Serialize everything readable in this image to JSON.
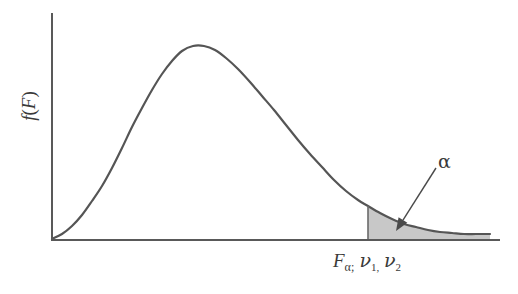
{
  "figure": {
    "background_color": "#ffffff",
    "curve_color": "#555555",
    "axis_color": "#595959",
    "shade_color": "#c8c8c8",
    "text_color": "#3a3a3a"
  },
  "labels": {
    "y_axis": "f(F)",
    "y_axis_func": "f",
    "y_axis_open": "(",
    "y_axis_var": "F",
    "y_axis_close": ")",
    "x_axis_base": "F",
    "x_axis_sub_alpha": "α;",
    "x_axis_nu": "ν",
    "x_axis_nu1": "1,",
    "x_axis_nu2": "2",
    "tail_annotation": "α"
  },
  "chart_data": {
    "type": "line",
    "title": "",
    "xlabel": "Fα; ν1, ν2",
    "ylabel": "f(F)",
    "grid": false,
    "legend": "none",
    "distribution": "F-distribution probability density",
    "axis_pixel_geometry": {
      "y_axis_x": 52,
      "y_axis_top_y": 13,
      "baseline_y": 240,
      "baseline_right_x": 500,
      "curve_right_end_x": 490
    },
    "peak": {
      "x": 193,
      "y": 46
    },
    "critical_value_x": 368,
    "curve_points": [
      [
        52,
        239
      ],
      [
        62,
        234
      ],
      [
        72,
        226
      ],
      [
        82,
        215
      ],
      [
        92,
        201
      ],
      [
        102,
        186
      ],
      [
        112,
        168
      ],
      [
        122,
        148
      ],
      [
        132,
        127
      ],
      [
        142,
        108
      ],
      [
        152,
        90
      ],
      [
        162,
        74
      ],
      [
        172,
        61
      ],
      [
        182,
        51
      ],
      [
        193,
        46
      ],
      [
        204,
        46
      ],
      [
        215,
        50
      ],
      [
        226,
        58
      ],
      [
        238,
        69
      ],
      [
        250,
        82
      ],
      [
        262,
        96
      ],
      [
        274,
        110
      ],
      [
        286,
        125
      ],
      [
        298,
        140
      ],
      [
        310,
        154
      ],
      [
        322,
        167
      ],
      [
        334,
        180
      ],
      [
        346,
        191
      ],
      [
        358,
        200
      ],
      [
        368,
        206
      ],
      [
        380,
        213
      ],
      [
        392,
        219
      ],
      [
        404,
        224
      ],
      [
        416,
        227
      ],
      [
        428,
        230
      ],
      [
        440,
        232
      ],
      [
        452,
        233
      ],
      [
        464,
        234
      ],
      [
        476,
        234
      ],
      [
        490,
        234
      ]
    ],
    "shaded_region": {
      "label": "α",
      "from_x": 368,
      "to_x": 490,
      "description": "upper tail rejection region of area alpha"
    },
    "annotation_arrow": {
      "from": [
        436,
        168
      ],
      "to": [
        396,
        231
      ]
    }
  }
}
